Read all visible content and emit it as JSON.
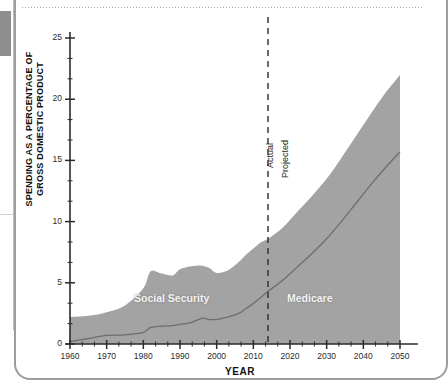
{
  "chart_data": {
    "type": "area",
    "title": "",
    "xlabel": "YEAR",
    "ylabel": "SPENDING AS A PERCENTAGE OF GROSS DOMESTIC PRODUCT",
    "ylabel_line1": "SPENDING AS A PERCENTAGE OF",
    "ylabel_line2": "GROSS DOMESTIC PRODUCT",
    "xlim": [
      1960,
      2050
    ],
    "ylim": [
      0,
      25
    ],
    "xticks": [
      1960,
      1970,
      1980,
      1990,
      2000,
      2010,
      2020,
      2030,
      2040,
      2050
    ],
    "xtick_labels": [
      "1960",
      "1970",
      "1980",
      "1990",
      "2000",
      "2010",
      "2020",
      "2030",
      "2040",
      "2050"
    ],
    "yticks": [
      0,
      5,
      10,
      15,
      20,
      25
    ],
    "ytick_labels": [
      "0",
      "5",
      "10",
      "15",
      "20",
      "25"
    ],
    "minor_xticks_per_decade": 2,
    "minor_yticks_per_interval": 2,
    "grid": false,
    "legend_position": "in-plot",
    "stacked": true,
    "fill_color": "#a3a3a3",
    "line_color": "#6e6e6e",
    "axis_color": "#2b2b2b",
    "series": [
      {
        "name": "Social Security",
        "label_in_plot": "Social Security",
        "x": [
          1960,
          1965,
          1970,
          1975,
          1980,
          1982,
          1985,
          1988,
          1990,
          1993,
          1996,
          1998,
          2000,
          2003,
          2006,
          2008,
          2010,
          2012,
          2014,
          2018,
          2022,
          2026,
          2030,
          2034,
          2038,
          2042,
          2046,
          2050
        ],
        "values": [
          0.2,
          0.45,
          0.7,
          0.75,
          0.95,
          1.35,
          1.45,
          1.5,
          1.6,
          1.75,
          2.1,
          2.0,
          2.0,
          2.2,
          2.5,
          2.9,
          3.3,
          3.8,
          4.3,
          5.2,
          6.3,
          7.4,
          8.6,
          10.0,
          11.5,
          13.0,
          14.4,
          15.7
        ]
      },
      {
        "name": "Medicare",
        "label_in_plot": "Medicare",
        "x": [
          1960,
          1965,
          1970,
          1975,
          1980,
          1982,
          1985,
          1988,
          1990,
          1993,
          1996,
          1998,
          2000,
          2003,
          2006,
          2008,
          2010,
          2012,
          2014,
          2018,
          2022,
          2026,
          2030,
          2034,
          2038,
          2042,
          2046,
          2050
        ],
        "values": [
          2.0,
          1.85,
          1.9,
          2.4,
          3.6,
          4.6,
          4.3,
          4.1,
          4.5,
          4.6,
          4.3,
          4.2,
          3.8,
          3.8,
          4.2,
          4.4,
          4.5,
          4.5,
          4.3,
          4.3,
          4.5,
          4.7,
          4.9,
          5.2,
          5.5,
          5.8,
          6.1,
          6.3
        ]
      }
    ],
    "total_band_top": {
      "name": "Social Security + Medicare (total)",
      "x": [
        1960,
        1965,
        1970,
        1975,
        1980,
        1982,
        1985,
        1988,
        1990,
        1993,
        1996,
        1998,
        2000,
        2003,
        2006,
        2008,
        2010,
        2012,
        2014,
        2018,
        2022,
        2026,
        2030,
        2034,
        2038,
        2042,
        2046,
        2050
      ],
      "values": [
        2.2,
        2.3,
        2.6,
        3.15,
        4.55,
        5.95,
        5.75,
        5.6,
        6.1,
        6.35,
        6.4,
        6.2,
        5.8,
        6.0,
        6.7,
        7.3,
        7.8,
        8.3,
        8.6,
        9.5,
        10.8,
        12.1,
        13.5,
        15.2,
        17.0,
        18.8,
        20.5,
        22.0
      ]
    },
    "annotations": [
      {
        "name": "divider",
        "type": "vline",
        "x": 2014,
        "style": "dashed",
        "left_label": "Actual",
        "right_label": "Projected"
      }
    ]
  },
  "divider": {
    "actual_label": "Actual",
    "projected_label": "Projected"
  }
}
